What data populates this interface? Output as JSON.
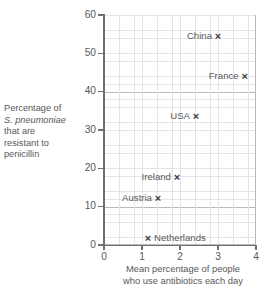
{
  "chart_data": {
    "type": "scatter",
    "title": "",
    "xlabel": "Mean percentage of people who use antibiotics each day",
    "xlabel_lines": [
      "Mean percentage of people",
      "who use antibiotics each day"
    ],
    "ylabel": "Percentage of S. pneumoniae that are resistant to penicillin",
    "ylabel_lines": [
      {
        "text": "Percentage of",
        "italic": false
      },
      {
        "text": "S. pneumoniae",
        "italic": true
      },
      {
        "text": "that are",
        "italic": false
      },
      {
        "text": "resistant to",
        "italic": false
      },
      {
        "text": "penicillin",
        "italic": false
      }
    ],
    "xlim": [
      0,
      4
    ],
    "ylim": [
      0,
      60
    ],
    "xticks": [
      "0",
      "1",
      "2",
      "3",
      "4"
    ],
    "xtick_values": [
      0,
      1,
      2,
      3,
      4
    ],
    "yticks": [
      "0",
      "10",
      "20",
      "30",
      "40",
      "50",
      "60"
    ],
    "ytick_values": [
      0,
      10,
      20,
      30,
      40,
      50,
      60
    ],
    "grid": true,
    "grid_minor_divisions": 5,
    "legend": "none",
    "marker": "×",
    "points": [
      {
        "label": "China",
        "x": 3.0,
        "y": 54.5,
        "label_side": "left"
      },
      {
        "label": "France",
        "x": 3.7,
        "y": 44.0,
        "label_side": "left"
      },
      {
        "label": "USA",
        "x": 2.42,
        "y": 33.6,
        "label_side": "left"
      },
      {
        "label": "Ireland",
        "x": 1.92,
        "y": 17.8,
        "label_side": "left"
      },
      {
        "label": "Austria",
        "x": 1.42,
        "y": 12.3,
        "label_side": "left"
      },
      {
        "label": "Netherlands",
        "x": 1.16,
        "y": 1.8,
        "label_side": "right"
      }
    ]
  },
  "colors": {
    "text": "#58585a",
    "axis": "#6f7073",
    "grid_major": "#b6b9be",
    "grid_minor": "#e2e4e8",
    "marker": "#3c3c3e",
    "background": "#ffffff"
  }
}
